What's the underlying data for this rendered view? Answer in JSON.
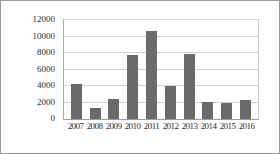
{
  "chart_data": {
    "type": "bar",
    "title": "",
    "xlabel": "",
    "ylabel": "",
    "categories": [
      "2007",
      "2008",
      "2009",
      "2010",
      "2011",
      "2012",
      "2013",
      "2014",
      "2015",
      "2016"
    ],
    "values": [
      4300,
      1350,
      2400,
      7700,
      10700,
      4000,
      7900,
      2050,
      1950,
      2350
    ],
    "series": [
      {
        "name": "",
        "values": [
          4300,
          1350,
          2400,
          7700,
          10700,
          4000,
          7900,
          2050,
          1950,
          2350
        ]
      }
    ],
    "ylim": [
      0,
      12000
    ],
    "ytick_values": [
      0,
      2000,
      4000,
      6000,
      8000,
      10000,
      12000
    ],
    "ytick_labels": [
      "0",
      "2000",
      "4000",
      "6000",
      "8000",
      "10000",
      "12000"
    ],
    "grid": true,
    "legend": "none",
    "bar_color": "#6a6a6a",
    "gridline_color": "#d2d2d2",
    "axis_color": "#9d9d9d",
    "background_color": "#ffffff",
    "text_color": "#2b2b2b"
  }
}
